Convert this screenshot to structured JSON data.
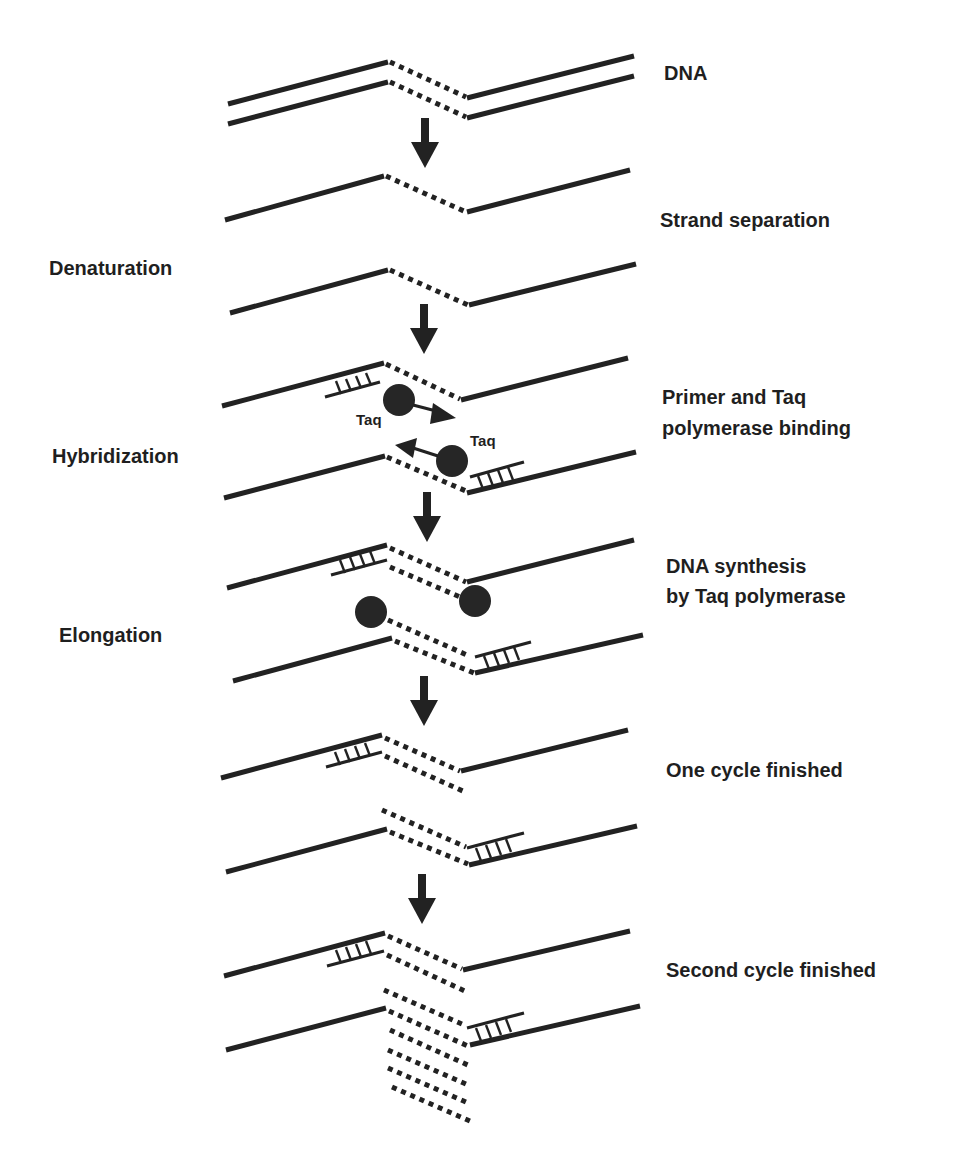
{
  "stages_left": [
    {
      "id": "denaturation",
      "label": "Denaturation"
    },
    {
      "id": "hybridization",
      "label": "Hybridization"
    },
    {
      "id": "elongation",
      "label": "Elongation"
    }
  ],
  "steps_right": [
    {
      "id": "dna",
      "label": "DNA"
    },
    {
      "id": "strand-separation",
      "label": "Strand separation"
    },
    {
      "id": "primer-binding",
      "label": "Primer and Taq",
      "label2": "polymerase binding"
    },
    {
      "id": "synthesis",
      "label": "DNA synthesis",
      "label2": "by Taq polymerase"
    },
    {
      "id": "one-cycle",
      "label": "One cycle finished"
    },
    {
      "id": "second-cycle",
      "label": "Second cycle finished"
    }
  ],
  "enzyme_labels": {
    "taq_top": "Taq",
    "taq_bottom": "Taq"
  },
  "colors": {
    "ink": "#222222",
    "background": "#ffffff"
  }
}
